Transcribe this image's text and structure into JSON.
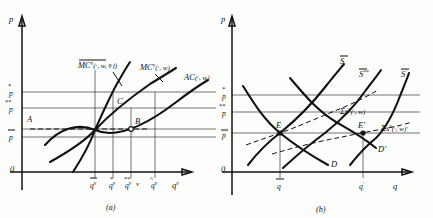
{
  "figure": {
    "panels": [
      {
        "id": "a",
        "caption": "(a)",
        "axis": {
          "y_label": "p",
          "x_label": "q",
          "x_label_sup": "v",
          "origin": "0"
        },
        "y_ticks": [
          {
            "base": "p",
            "mark": "star1",
            "text": "p"
          },
          {
            "base": "p",
            "mark": "star2",
            "text": "p"
          },
          {
            "base": "p",
            "mark": "bar",
            "text": "p"
          }
        ],
        "x_ticks": [
          {
            "base": "q",
            "mark": "bar",
            "sup": "v"
          },
          {
            "base": "q",
            "mark": "star1",
            "sup": "v"
          },
          {
            "base": "q",
            "mark": "star2",
            "sup": "v"
          },
          {
            "base": "q",
            "mark": "hat",
            "sup": "v"
          }
        ],
        "curves": [
          {
            "name": "mc-bar-curve",
            "label": "MC",
            "label_sup": "v",
            "label_args": "(·, w, v̄ f)",
            "overline": true
          },
          {
            "name": "mc-curve",
            "label": "MC",
            "label_sup": "v",
            "label_args": "(·, w)",
            "overline": false
          },
          {
            "name": "ac-curve",
            "label": "AC",
            "label_sup": "",
            "label_args": "(·, w)",
            "overline": false
          }
        ],
        "points": [
          {
            "name": "point-A",
            "label": "A"
          },
          {
            "name": "point-B",
            "label": "B"
          },
          {
            "name": "point-C",
            "label": "C"
          },
          {
            "name": "point-v",
            "label": "v"
          }
        ]
      },
      {
        "id": "b",
        "caption": "(b)",
        "axis": {
          "y_label": "p",
          "x_label": "q",
          "origin": "0"
        },
        "y_ticks": [
          {
            "base": "p",
            "mark": "star1",
            "text": "p"
          },
          {
            "base": "p",
            "mark": "star2",
            "text": "p"
          },
          {
            "base": "p",
            "mark": "bar",
            "text": "p"
          }
        ],
        "x_ticks": [
          {
            "base": "q",
            "mark": "bar"
          },
          {
            "base": "q",
            "mark": "prime"
          }
        ],
        "curves": [
          {
            "name": "supply-sbar",
            "label": "S",
            "mark": "bar",
            "suffix": ""
          },
          {
            "name": "supply-sbar-starstar",
            "label": "S",
            "mark": "bar",
            "suffix": "**"
          },
          {
            "name": "supply-sbar-prime",
            "label": "S",
            "mark": "bar",
            "suffix": "'"
          },
          {
            "name": "sum-s-curve",
            "label": "Σs",
            "label_sup": "v",
            "label_args": "(·, w)"
          },
          {
            "name": "sum-s-prime-curve",
            "label": "Σs",
            "label_sup": "v",
            "label_args": "(·, w)'"
          },
          {
            "name": "demand-D",
            "label": "D"
          },
          {
            "name": "demand-D-prime",
            "label": "D'"
          }
        ],
        "points": [
          {
            "name": "equilibrium-E",
            "label": "E"
          },
          {
            "name": "equilibrium-E-prime",
            "label": "E'"
          }
        ]
      }
    ]
  },
  "colors": {
    "ink": "#111111",
    "paper": "#fdfdfb",
    "guide": "#333333"
  }
}
